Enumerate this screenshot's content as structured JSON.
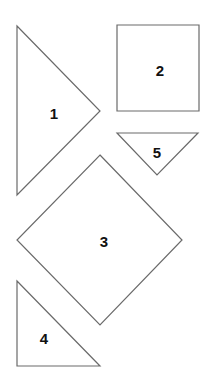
{
  "diagram": {
    "stroke_color": "#6a6a6a",
    "label_color": "#111111",
    "shapes": [
      {
        "id": "1",
        "label": "1",
        "type": "triangle",
        "points": "17,26 100,111 17,195",
        "label_pos": [
          54,
          113
        ]
      },
      {
        "id": "2",
        "label": "2",
        "type": "square",
        "points": "117,25 199,25 199,111 117,111",
        "label_pos": [
          160,
          70
        ]
      },
      {
        "id": "5",
        "label": "5",
        "type": "triangle",
        "points": "117,133 198,133 157,175",
        "label_pos": [
          157,
          153
        ]
      },
      {
        "id": "3",
        "label": "3",
        "type": "diamond",
        "points": "100,155 182,240 100,325 17,240",
        "label_pos": [
          104,
          241
        ]
      },
      {
        "id": "4",
        "label": "4",
        "type": "triangle",
        "points": "17,281 100,366 17,366",
        "label_pos": [
          44,
          338
        ]
      }
    ]
  }
}
